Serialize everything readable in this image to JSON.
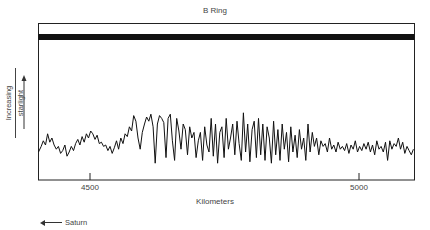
{
  "chart_data": {
    "type": "line",
    "title": "B Ring",
    "xlabel": "Kilometers",
    "ylabel": "Increasing starlight",
    "ylabel_lines": [
      "Increasing",
      "starlight"
    ],
    "xlim": [
      4403,
      5102
    ],
    "xticks": [
      4500,
      5000
    ],
    "xtick_labels": [
      "4500",
      "5000"
    ],
    "grid": false,
    "legend": null,
    "annotation": "Saturn",
    "annotation_direction": "left",
    "band": {
      "description": "opaque ring band near top of frame",
      "intensity": 98
    },
    "series": [
      {
        "name": "B Ring occultation profile",
        "color": "#111111",
        "x": [
          4403,
          4408,
          4412,
          4416,
          4420,
          4424,
          4428,
          4432,
          4436,
          4440,
          4444,
          4448,
          4452,
          4456,
          4460,
          4464,
          4468,
          4472,
          4476,
          4480,
          4484,
          4488,
          4492,
          4496,
          4500,
          4504,
          4508,
          4512,
          4516,
          4520,
          4524,
          4528,
          4532,
          4536,
          4540,
          4544,
          4548,
          4552,
          4556,
          4560,
          4564,
          4568,
          4572,
          4576,
          4580,
          4584,
          4588,
          4592,
          4596,
          4600,
          4604,
          4608,
          4612,
          4616,
          4620,
          4624,
          4628,
          4632,
          4636,
          4640,
          4644,
          4648,
          4652,
          4656,
          4660,
          4664,
          4668,
          4672,
          4676,
          4680,
          4684,
          4688,
          4692,
          4696,
          4700,
          4704,
          4708,
          4712,
          4716,
          4720,
          4724,
          4728,
          4732,
          4736,
          4740,
          4744,
          4748,
          4752,
          4756,
          4760,
          4764,
          4768,
          4772,
          4776,
          4780,
          4784,
          4788,
          4792,
          4796,
          4800,
          4804,
          4808,
          4812,
          4816,
          4820,
          4824,
          4828,
          4832,
          4836,
          4840,
          4844,
          4848,
          4852,
          4856,
          4860,
          4864,
          4868,
          4872,
          4876,
          4880,
          4884,
          4888,
          4892,
          4896,
          4900,
          4904,
          4908,
          4912,
          4916,
          4920,
          4924,
          4928,
          4932,
          4936,
          4940,
          4944,
          4948,
          4952,
          4956,
          4960,
          4964,
          4968,
          4972,
          4976,
          4980,
          4984,
          4988,
          4992,
          4996,
          5000,
          5004,
          5008,
          5012,
          5016,
          5020,
          5024,
          5028,
          5032,
          5036,
          5040,
          5044,
          5048,
          5052,
          5056,
          5060,
          5064,
          5068,
          5072,
          5076,
          5080,
          5084,
          5088,
          5092,
          5096,
          5100
        ],
        "y": [
          20,
          24,
          28,
          25,
          33,
          27,
          30,
          25,
          22,
          24,
          19,
          21,
          25,
          17,
          20,
          24,
          21,
          26,
          29,
          25,
          31,
          27,
          33,
          30,
          35,
          33,
          29,
          32,
          26,
          27,
          24,
          25,
          21,
          24,
          19,
          23,
          28,
          22,
          30,
          26,
          33,
          31,
          38,
          35,
          46,
          42,
          30,
          22,
          34,
          40,
          45,
          42,
          47,
          38,
          12,
          40,
          46,
          44,
          41,
          16,
          44,
          47,
          28,
          14,
          44,
          35,
          22,
          40,
          36,
          18,
          38,
          30,
          34,
          16,
          28,
          34,
          14,
          38,
          25,
          20,
          44,
          17,
          40,
          12,
          34,
          38,
          16,
          44,
          22,
          30,
          40,
          18,
          42,
          26,
          14,
          48,
          20,
          40,
          13,
          36,
          42,
          16,
          44,
          18,
          40,
          14,
          38,
          30,
          12,
          42,
          18,
          36,
          14,
          40,
          22,
          34,
          13,
          38,
          20,
          32,
          16,
          36,
          22,
          30,
          14,
          40,
          20,
          34,
          24,
          30,
          18,
          28,
          24,
          26,
          20,
          30,
          22,
          25,
          20,
          27,
          22,
          24,
          21,
          26,
          19,
          25,
          22,
          28,
          20,
          24,
          21,
          26,
          22,
          27,
          20,
          25,
          18,
          28,
          22,
          24,
          20,
          27,
          14,
          28,
          22,
          26,
          24,
          30,
          22,
          27,
          19,
          24,
          21,
          18,
          22
        ]
      }
    ]
  }
}
